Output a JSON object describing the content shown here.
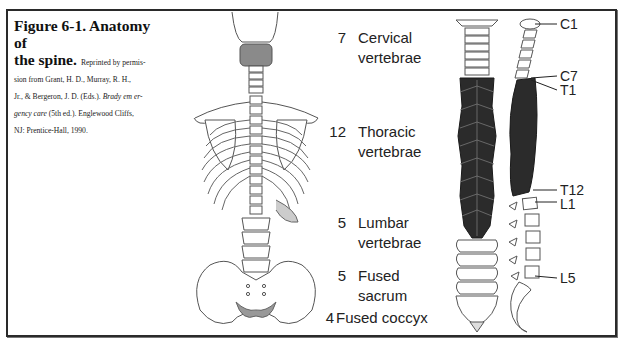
{
  "figure": {
    "title": "Figure 6-1. Anatomy of the spine.",
    "title_line1": "Figure 6-1. Anatomy of",
    "title_line2": "the spine.",
    "credit_line2_tail": "Reprinted by permis-",
    "credit_line3": "sion from Grant, H. D., Murray, R. H.,",
    "credit_line4_pre": "Jr., & Bergeron, J. D. (Eds.).",
    "credit_line4_italic": "Brady em er-",
    "credit_line5_italic": "gency care",
    "credit_line5_post": "(5th ed.). Englewood Cliffs,",
    "credit_line6": "NJ: Prentice-Hall, 1990."
  },
  "regions": [
    {
      "count": "7",
      "line1": "Cervical",
      "line2": "vertebrae"
    },
    {
      "count": "12",
      "line1": "Thoracic",
      "line2": "vertebrae"
    },
    {
      "count": "5",
      "line1": "Lumbar",
      "line2": "vertebrae"
    },
    {
      "count": "5",
      "line1": "Fused",
      "line2": "sacrum"
    },
    {
      "count": "4",
      "line1": "Fused coccyx",
      "line2": ""
    }
  ],
  "vertebra_labels": [
    "C1",
    "C7",
    "T1",
    "T12",
    "L1",
    "L5"
  ],
  "colors": {
    "frame": "#2a2a2a",
    "thoracic_fill": "#2b2b2b",
    "bone_line": "#555555",
    "shading": "#9a9a9a"
  }
}
